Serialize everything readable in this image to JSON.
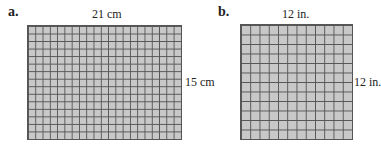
{
  "figures": [
    {
      "label": "a.",
      "top_dimension": "21 cm",
      "side_dimension": "15 cm",
      "columns": 21,
      "rows": 15
    },
    {
      "label": "b.",
      "top_dimension": "12 in.",
      "side_dimension": "12 in.",
      "columns": 12,
      "rows": 12
    }
  ],
  "colors": {
    "grid_fill": "#c8c8c8",
    "grid_line": "#555555"
  }
}
